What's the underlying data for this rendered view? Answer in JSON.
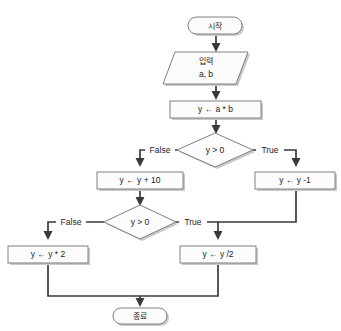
{
  "diagram": {
    "language": "ko",
    "colors": {
      "node_fill": "#fcfcfc",
      "node_stroke": "#808080",
      "connector": "#3a3a3a",
      "shadow": "#c9c9c9",
      "background": "#ffffff",
      "text": "#1d1d1d"
    },
    "nodes": {
      "start": {
        "label": "시작",
        "shape": "terminator"
      },
      "input": {
        "label_line1": "입력",
        "label_line2": "a, b",
        "shape": "parallelogram"
      },
      "assign_product": {
        "label": "y ← a * b",
        "shape": "process"
      },
      "decision1": {
        "label": "y > 0",
        "shape": "decision"
      },
      "add_ten": {
        "label": "y ← y + 10",
        "shape": "process"
      },
      "minus_one": {
        "label": "y ← y -1",
        "shape": "process"
      },
      "decision2": {
        "label": "y > 0",
        "shape": "decision"
      },
      "times_two": {
        "label": "y ← y * 2",
        "shape": "process"
      },
      "div_two": {
        "label": "y ← y /2",
        "shape": "process"
      },
      "end": {
        "label": "종료",
        "shape": "terminator"
      }
    },
    "edge_labels": {
      "d1_false": "False",
      "d1_true": "True",
      "d2_false": "False",
      "d2_true": "True"
    }
  }
}
